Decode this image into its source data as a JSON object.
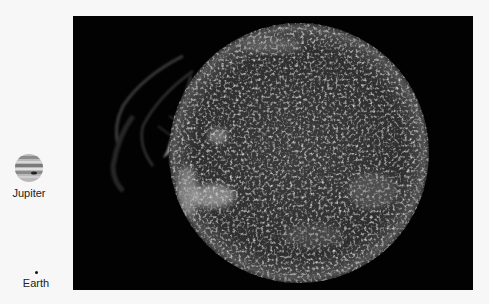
{
  "image": {
    "subject": "Sun compared with planet sizes",
    "panel_background": "#020202",
    "page_background": "#f7f7f7"
  },
  "legend": {
    "items": [
      {
        "label": "Jupiter",
        "icon": "jupiter-icon"
      },
      {
        "label": "Earth",
        "icon": "earth-dot-icon"
      }
    ]
  },
  "sun": {
    "center_x": 226,
    "center_y": 137,
    "radius": 130,
    "color_base": "#3a3a3a",
    "color_bright": "#cfcfcf"
  }
}
